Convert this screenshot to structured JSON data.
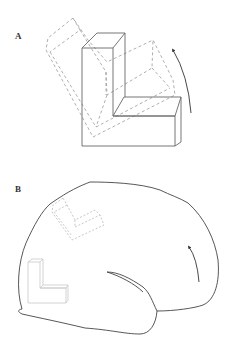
{
  "figure": {
    "panels": [
      {
        "label": "A",
        "description": "Solid 3D L-shaped block with a dashed rotated copy and a curved rotation arrow",
        "elements": [
          "solid-l-block",
          "dashed-rotated-l-block",
          "rotation-arrow"
        ]
      },
      {
        "label": "B",
        "description": "Lateral brain outline with a small solid L-block, a dashed rotated L-block, and a curved arrow",
        "elements": [
          "brain-outline",
          "small-solid-l-block",
          "small-dashed-l-block",
          "rotation-arrow",
          "sulcus-line"
        ]
      }
    ],
    "colors": {
      "solid_stroke": "#666666",
      "dashed_stroke": "#9a9a9a",
      "faint_stroke": "#c8c8c8",
      "brain_stroke": "#444444",
      "arrow": "#333333",
      "background": "#ffffff"
    }
  }
}
